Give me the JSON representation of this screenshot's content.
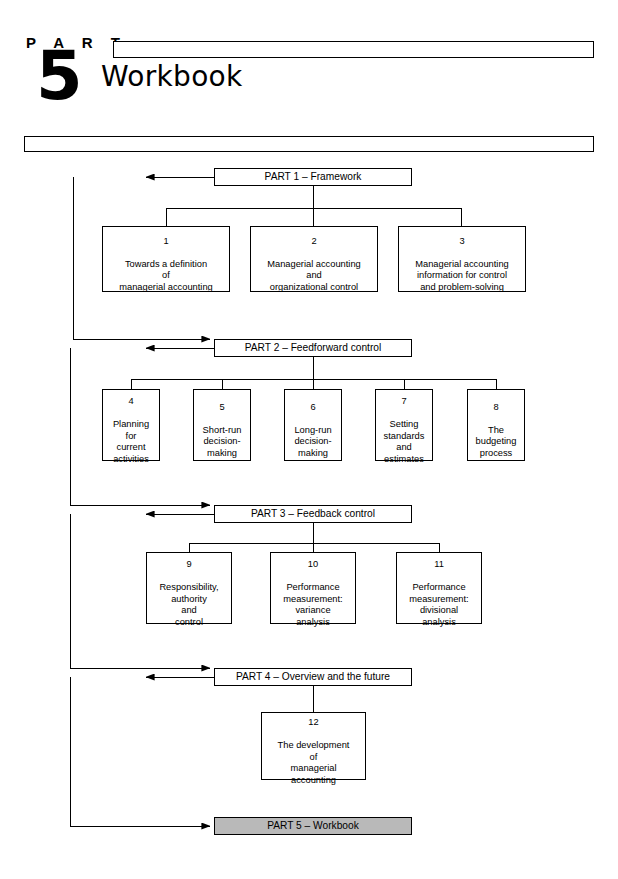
{
  "header": {
    "part_word": "P A R T",
    "part_number": "5",
    "title": "Workbook"
  },
  "diagram": {
    "parts": [
      {
        "id": "part1",
        "label": "PART 1 – Framework"
      },
      {
        "id": "part2",
        "label": "PART 2 – Feedforward control"
      },
      {
        "id": "part3",
        "label": "PART 3 – Feedback control"
      },
      {
        "id": "part4",
        "label": "PART 4 – Overview and the future"
      },
      {
        "id": "part5",
        "label": "PART 5 – Workbook"
      }
    ],
    "chapters": [
      {
        "number": "1",
        "title": "Towards a definition\nof\nmanagerial accounting"
      },
      {
        "number": "2",
        "title": "Managerial accounting\nand\norganizational control"
      },
      {
        "number": "3",
        "title": "Managerial accounting\ninformation for control\nand problem-solving"
      },
      {
        "number": "4",
        "title": "Planning\nfor\ncurrent\nactivities"
      },
      {
        "number": "5",
        "title": "Short-run\ndecision-\nmaking"
      },
      {
        "number": "6",
        "title": "Long-run\ndecision-\nmaking"
      },
      {
        "number": "7",
        "title": "Setting\nstandards\nand\nestimates"
      },
      {
        "number": "8",
        "title": "The\nbudgeting\nprocess"
      },
      {
        "number": "9",
        "title": "Responsibility,\nauthority\nand\ncontrol"
      },
      {
        "number": "10",
        "title": "Performance\nmeasurement:\nvariance\nanalysis"
      },
      {
        "number": "11",
        "title": "Performance\nmeasurement:\ndivisional\nanalysis"
      },
      {
        "number": "12",
        "title": "The development\nof\nmanagerial\naccounting"
      }
    ],
    "colors": {
      "line": "#000000",
      "part5_fill": "#b9b9b9",
      "box_fill": "#ffffff"
    }
  }
}
